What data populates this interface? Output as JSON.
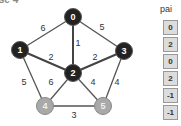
{
  "title": "Case 4",
  "graph": {
    "nodes": [
      {
        "id": "0",
        "x": 73,
        "y": 17,
        "style": "dark"
      },
      {
        "id": "1",
        "x": 20,
        "y": 50,
        "style": "dark"
      },
      {
        "id": "2",
        "x": 73,
        "y": 73,
        "style": "dark"
      },
      {
        "id": "3",
        "x": 124,
        "y": 51,
        "style": "dark"
      },
      {
        "id": "4",
        "x": 45,
        "y": 106,
        "style": "gray"
      },
      {
        "id": "5",
        "x": 103,
        "y": 106,
        "style": "gray"
      }
    ],
    "edges": [
      {
        "from": "0",
        "to": "1",
        "weight": "6",
        "lx": 43,
        "ly": 31,
        "bold": false
      },
      {
        "from": "0",
        "to": "3",
        "weight": "5",
        "lx": 102,
        "ly": 30,
        "bold": false
      },
      {
        "from": "0",
        "to": "2",
        "weight": "1",
        "lx": 78,
        "ly": 46,
        "bold": true
      },
      {
        "from": "1",
        "to": "2",
        "weight": "2",
        "lx": 51,
        "ly": 60,
        "bold": true
      },
      {
        "from": "3",
        "to": "2",
        "weight": "2",
        "lx": 95,
        "ly": 60,
        "bold": true
      },
      {
        "from": "1",
        "to": "4",
        "weight": "5",
        "lx": 24,
        "ly": 85,
        "bold": false
      },
      {
        "from": "2",
        "to": "4",
        "weight": "6",
        "lx": 51,
        "ly": 85,
        "bold": false
      },
      {
        "from": "2",
        "to": "5",
        "weight": "4",
        "lx": 93,
        "ly": 85,
        "bold": false
      },
      {
        "from": "3",
        "to": "5",
        "weight": "4",
        "lx": 117,
        "ly": 85,
        "bold": false
      },
      {
        "from": "4",
        "to": "5",
        "weight": "3",
        "lx": 74,
        "ly": 118,
        "bold": false
      }
    ]
  },
  "pai": {
    "header": "pai",
    "values": [
      "0",
      "2",
      "0",
      "2",
      "-1",
      "-1"
    ]
  }
}
